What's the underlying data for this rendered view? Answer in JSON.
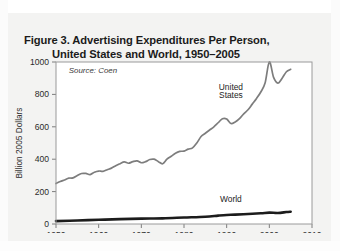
{
  "figure": {
    "title_line1": "Figure 3. Advertising Expenditures Per Person,",
    "title_line2": "United States and World, 1950–2005",
    "source_note": "Source: Coen"
  },
  "chart_data": {
    "type": "line",
    "title": "Figure 3. Advertising Expenditures Per Person, United States and World, 1950–2005",
    "xlabel": "",
    "ylabel": "Billion 2005 Dollars",
    "xlim": [
      1950,
      2010
    ],
    "ylim": [
      0,
      1000
    ],
    "xticks": [
      1950,
      1960,
      1970,
      1980,
      1990,
      2000,
      2010
    ],
    "xticklabels": [
      "1950",
      "1960",
      "1970",
      "1980",
      "1990",
      "2000",
      "2010"
    ],
    "yticks": [
      0,
      200,
      400,
      600,
      800,
      1000
    ],
    "yticklabels": [
      "0",
      "200",
      "400",
      "600",
      "800",
      "1000"
    ],
    "grid": false,
    "legend": "inline-annotations",
    "annotations": [
      {
        "text": "United",
        "x": 1991,
        "y": 830
      },
      {
        "text": "States",
        "x": 1991,
        "y": 780
      },
      {
        "text": "World",
        "x": 1991,
        "y": 135
      },
      {
        "text": "Source: Coen",
        "x": 1953,
        "y": 930
      }
    ],
    "series": [
      {
        "name": "United States",
        "color": "#7d7d7d",
        "width": 1.7,
        "x": [
          1950,
          1951,
          1952,
          1953,
          1954,
          1955,
          1956,
          1957,
          1958,
          1959,
          1960,
          1961,
          1962,
          1963,
          1964,
          1965,
          1966,
          1967,
          1968,
          1969,
          1970,
          1971,
          1972,
          1973,
          1974,
          1975,
          1976,
          1977,
          1978,
          1979,
          1980,
          1981,
          1982,
          1983,
          1984,
          1985,
          1986,
          1987,
          1988,
          1989,
          1990,
          1991,
          1992,
          1993,
          1994,
          1995,
          1996,
          1997,
          1998,
          1999,
          2000,
          2001,
          2002,
          2003,
          2004,
          2005
        ],
        "values": [
          250,
          262,
          272,
          283,
          285,
          300,
          312,
          312,
          305,
          320,
          327,
          325,
          335,
          345,
          360,
          372,
          383,
          375,
          385,
          390,
          378,
          385,
          398,
          400,
          385,
          372,
          400,
          418,
          437,
          448,
          450,
          462,
          470,
          500,
          540,
          560,
          580,
          600,
          625,
          650,
          648,
          620,
          630,
          650,
          680,
          705,
          740,
          775,
          815,
          870,
          1000,
          905,
          870,
          900,
          940,
          955
        ]
      },
      {
        "name": "World",
        "color": "#1c1c1c",
        "width": 2.6,
        "x": [
          1950,
          1955,
          1960,
          1965,
          1970,
          1975,
          1980,
          1985,
          1988,
          1990,
          1992,
          1995,
          1998,
          2000,
          2002,
          2004,
          2005
        ],
        "values": [
          18,
          22,
          26,
          30,
          33,
          35,
          40,
          45,
          52,
          56,
          58,
          62,
          66,
          70,
          68,
          74,
          76
        ]
      }
    ]
  }
}
